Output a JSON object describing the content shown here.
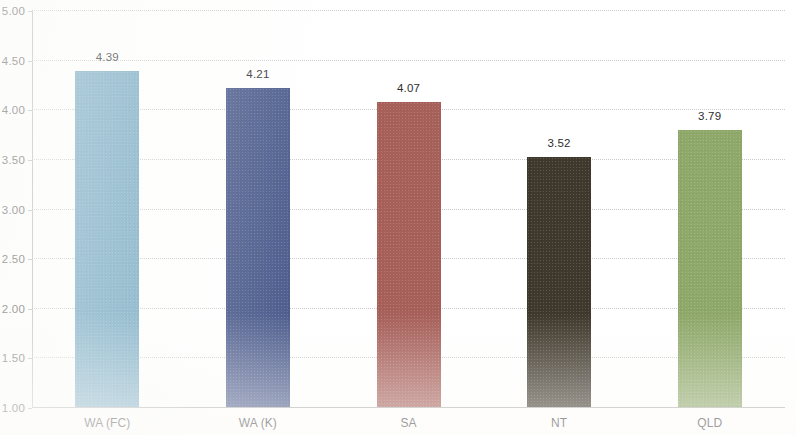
{
  "chart_data": {
    "type": "bar",
    "title": "",
    "subtitle": "",
    "xlabel": "",
    "ylabel": "",
    "categories": [
      "WA (FC)",
      "WA (K)",
      "SA",
      "NT",
      "QLD"
    ],
    "values": [
      4.39,
      4.21,
      4.07,
      3.52,
      3.79
    ],
    "value_labels": [
      "4.39",
      "4.21",
      "4.07",
      "3.52",
      "3.79"
    ],
    "bar_colors": [
      "#76aac4",
      "#4a5a8c",
      "#a8605a",
      "#3f382c",
      "#8fa96a"
    ],
    "ylim": [
      1.0,
      5.0
    ],
    "ytick_values": [
      5.0,
      4.5,
      4.0,
      3.5,
      3.0,
      2.5,
      2.0,
      1.5,
      1.0
    ],
    "ytick_labels": [
      "5.00",
      "4.50",
      "4.00",
      "3.50",
      "3.00",
      "2.50",
      "2.00",
      "1.50",
      "1.00"
    ],
    "grid": true,
    "legend": false,
    "legend_position": "none",
    "series": [
      {
        "name": "",
        "values": [
          4.39,
          4.21,
          4.07,
          3.52,
          3.79
        ]
      }
    ]
  },
  "axis": {
    "y_line_color": "#b9b9b9",
    "grid_color": "#c3c3c3"
  }
}
